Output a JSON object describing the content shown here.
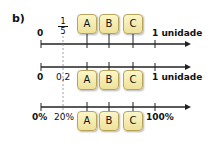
{
  "part_label": "b)",
  "lines": [
    {
      "start": "0",
      "fraction": {
        "num": "1",
        "den": "5"
      },
      "end": "1 unidade",
      "boxes": [
        "A",
        "B",
        "C"
      ]
    },
    {
      "start": "0",
      "mark": "0,2",
      "end": "1 unidade",
      "boxes": [
        "A",
        "B",
        "C"
      ]
    },
    {
      "start": "0%",
      "mark": "20%",
      "end": "100%",
      "boxes": [
        "A",
        "B",
        "C"
      ]
    }
  ],
  "colors": {
    "box_fill": "#f5eab0",
    "box_border": "#b8a55a",
    "axis": "#111111"
  }
}
